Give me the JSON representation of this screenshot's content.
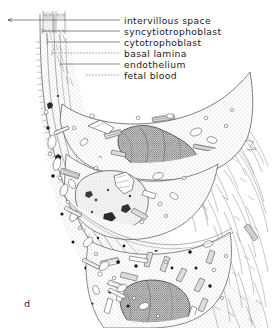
{
  "figure": {
    "panel_letter": "d",
    "labels": [
      {
        "id": "intervillous-space",
        "text": "intervillous space",
        "text_x": 124,
        "text_y": 23.5,
        "leader": {
          "type": "solid",
          "x1": 8,
          "y1": 20.0,
          "x2": 120,
          "y2": 20.0
        }
      },
      {
        "id": "syncytiotrophoblast",
        "text": "syncytiotrophoblast",
        "text_x": 124,
        "text_y": 34.5,
        "leader": {
          "type": "solid",
          "x1": 42,
          "y1": 31.0,
          "x2": 120,
          "y2": 31.0
        }
      },
      {
        "id": "cytotrophoblast",
        "text": "cytotrophoblast",
        "text_x": 124,
        "text_y": 45.5,
        "leader": {
          "type": "solid",
          "x1": 47,
          "y1": 42.0,
          "x2": 120,
          "y2": 42.0
        }
      },
      {
        "id": "basal-lamina",
        "text": "basal lamina",
        "text_x": 124,
        "text_y": 56.5,
        "leader": {
          "type": "dashed",
          "x1": 52,
          "y1": 53.0,
          "x2": 120,
          "y2": 53.0
        }
      },
      {
        "id": "endothelium",
        "text": "endothelium",
        "text_x": 124,
        "text_y": 67.5,
        "leader": {
          "type": "solid",
          "x1": 60,
          "y1": 64.0,
          "x2": 120,
          "y2": 64.0
        }
      },
      {
        "id": "fetal-blood",
        "text": "fetal blood",
        "text_x": 124,
        "text_y": 78.5,
        "leader": {
          "type": "dashed",
          "x1": 86,
          "y1": 75.0,
          "x2": 120,
          "y2": 75.0
        }
      }
    ],
    "colors": {
      "ink": "#3a3a3a",
      "text": "#1a1a1a",
      "background": "#ffffff",
      "cytoplasm_fill": "#f6f6f4",
      "granule": "#171717"
    }
  }
}
